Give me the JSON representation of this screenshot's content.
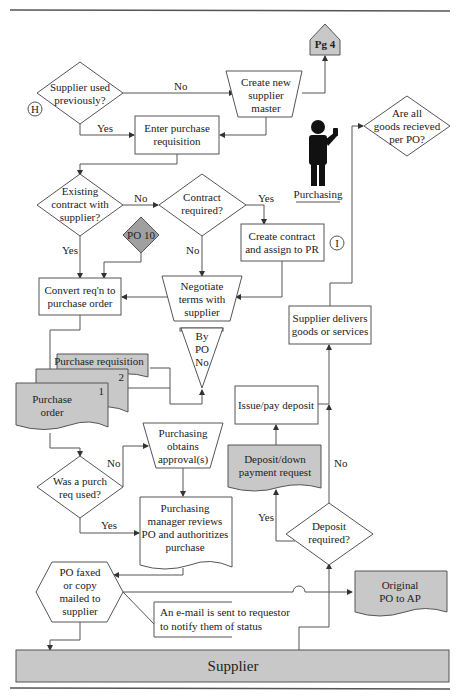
{
  "diagram": {
    "type": "flowchart",
    "title_lane": "Purchasing",
    "bottom_lane": "Supplier",
    "connectors": {
      "H": "H",
      "I": "I"
    },
    "nodes": {
      "supplier_used": [
        "Supplier used",
        "previously?"
      ],
      "create_supplier": [
        "Create new",
        "supplier",
        "master"
      ],
      "pg4": "Pg 4",
      "enter_req": [
        "Enter purchase",
        "requisition"
      ],
      "goods_received": [
        "Are all",
        "goods recieved",
        "per PO?"
      ],
      "existing_contract": [
        "Existing",
        "contract with",
        "supplier?"
      ],
      "contract_required": [
        "Contract",
        "required?"
      ],
      "po10": "PO 10",
      "create_contract": [
        "Create contract",
        "and assign to PR"
      ],
      "convert_req": [
        "Convert req'n to",
        "purchase order"
      ],
      "negotiate": [
        "Negotiate",
        "terms with",
        "supplier"
      ],
      "file": [
        "By",
        "PO",
        "No"
      ],
      "supplier_delivers": [
        "Supplier delivers",
        "goods or services"
      ],
      "purchase_requisition": "Purchase requisition",
      "copy2": "2",
      "copy1": "1",
      "purchase_order": [
        "Purchase",
        "order"
      ],
      "issue_deposit": "Issue/pay deposit",
      "obtains_approval": [
        "Purchasing",
        "obtains",
        "approval(s)"
      ],
      "deposit_request": [
        "Deposit/down",
        "payment request"
      ],
      "was_purch_req": [
        "Was a purch",
        "req used?"
      ],
      "manager_reviews": [
        "Purchasing",
        "manager reviews",
        "PO and authoritizes",
        "purchase"
      ],
      "deposit_required": [
        "Deposit",
        "required?"
      ],
      "po_faxed": [
        "PO faxed",
        "or copy",
        "mailed to",
        "supplier"
      ],
      "original_po": [
        "Original",
        "PO to AP"
      ],
      "email_note": [
        "An e-mail is sent to requestor",
        "to notify them of status"
      ]
    },
    "edge_labels": {
      "no1": "No",
      "yes1": "Yes",
      "no2": "No",
      "yes2": "Yes",
      "yes3": "Yes",
      "no3": "No",
      "no4": "No",
      "yes4": "Yes",
      "yes5": "Yes",
      "no5": "No"
    }
  }
}
